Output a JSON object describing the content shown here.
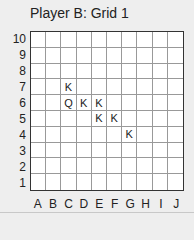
{
  "title": "Player B: Grid 1",
  "grid": {
    "columns": [
      "A",
      "B",
      "C",
      "D",
      "E",
      "F",
      "G",
      "H",
      "I",
      "J"
    ],
    "rows": [
      "10",
      "9",
      "8",
      "7",
      "6",
      "5",
      "4",
      "3",
      "2",
      "1"
    ],
    "cells": [
      [
        "",
        "",
        "",
        "",
        "",
        "",
        "",
        "",
        "",
        ""
      ],
      [
        "",
        "",
        "",
        "",
        "",
        "",
        "",
        "",
        "",
        ""
      ],
      [
        "",
        "",
        "",
        "",
        "",
        "",
        "",
        "",
        "",
        ""
      ],
      [
        "",
        "",
        "K",
        "",
        "",
        "",
        "",
        "",
        "",
        ""
      ],
      [
        "",
        "",
        "Q",
        "K",
        "K",
        "",
        "",
        "",
        "",
        ""
      ],
      [
        "",
        "",
        "",
        "",
        "K",
        "K",
        "",
        "",
        "",
        ""
      ],
      [
        "",
        "",
        "",
        "",
        "",
        "",
        "K",
        "",
        "",
        ""
      ],
      [
        "",
        "",
        "",
        "",
        "",
        "",
        "",
        "",
        "",
        ""
      ],
      [
        "",
        "",
        "",
        "",
        "",
        "",
        "",
        "",
        "",
        ""
      ],
      [
        "",
        "",
        "",
        "",
        "",
        "",
        "",
        "",
        "",
        ""
      ]
    ]
  }
}
